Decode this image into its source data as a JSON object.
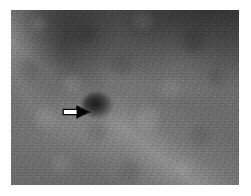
{
  "page": {
    "width": 251,
    "height": 196,
    "background_color": "#ffffff",
    "type": "grayscale-medical-scan-figure"
  },
  "scan": {
    "label": "grayscale tissue scan",
    "plate": {
      "x": 11,
      "y": 10,
      "width": 228,
      "height": 175
    },
    "base_gray": "#6b6b6b",
    "regions": [
      {
        "name": "upper-right-dark-corner",
        "tone": "#3c3c3c",
        "description": "dark shadowed corner"
      },
      {
        "name": "upper-left-dark-band",
        "tone": "#4e4e4e",
        "description": "vertical dark band"
      },
      {
        "name": "bright-diagonal-band",
        "tone": "#9a9a9a",
        "description": "bright band sweeping lower-left to upper-right"
      },
      {
        "name": "mid-left-mottled-field",
        "tone": "#787878",
        "description": "mottled mid-gray tissue"
      }
    ]
  },
  "lesion": {
    "name": "focal-dark-lesion",
    "x": 82,
    "y": 92,
    "width": 30,
    "height": 26,
    "tone": "#1b1b1b",
    "description": "rounded hypoechoic dark focus"
  },
  "annotation": {
    "type": "arrow",
    "direction": "right",
    "x": 62,
    "y": 105,
    "width": 28,
    "height": 14,
    "outline_color": "#ffffff",
    "fill_color": "#000000",
    "points_at": "focal-dark-lesion"
  }
}
